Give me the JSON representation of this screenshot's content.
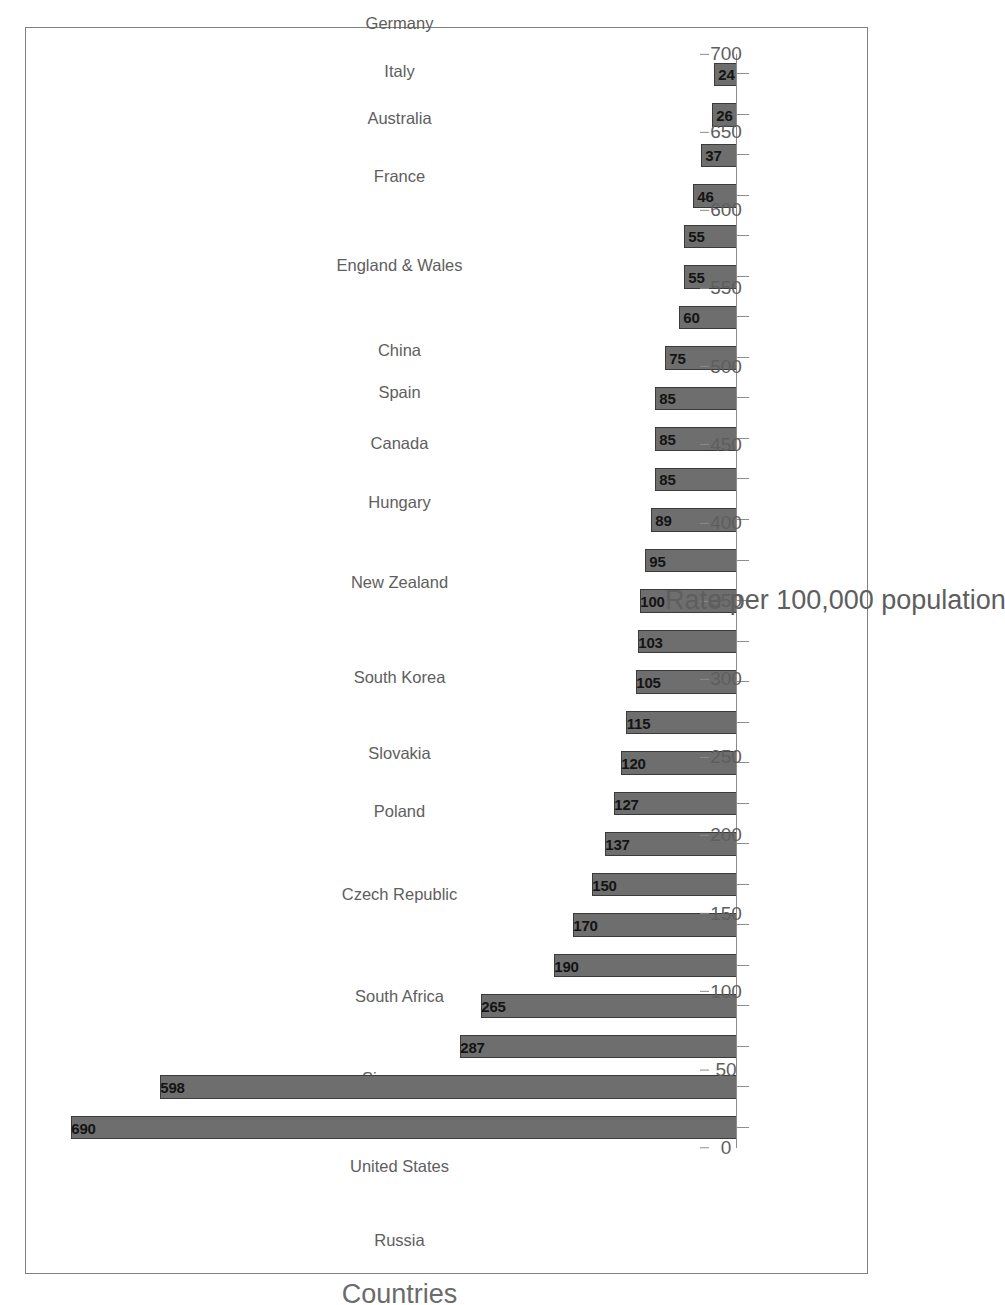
{
  "chart_data": {
    "type": "bar",
    "orientation": "vertical-rotated-90ccw",
    "title": "",
    "xlabel": "Countries",
    "ylabel": "Rate per 100,000 population",
    "ylim": [
      0,
      700
    ],
    "ytick_step": 50,
    "grid": false,
    "legend": null,
    "bar_color": "#6e6e6e",
    "bar_outline_color": "#3b3b3b",
    "axis_color": "#8c8c8c",
    "text_color": "#5e5e5e",
    "value_label_color": "#141414",
    "categories": [
      "Russia",
      "United States",
      "Singapore",
      "South Africa",
      "Czech Republic",
      "Poland",
      "Slovakia",
      "South Korea",
      "New Zealand",
      "Hungary",
      "Canada",
      "Spain",
      "China",
      "England & Wales",
      "France",
      "Australia",
      "Italy",
      "Germany",
      "Austria",
      "Belgium",
      "Finland",
      "Ireland",
      "Greece",
      "Soloman Islands",
      "Japan",
      "Philippines",
      "India"
    ],
    "values": [
      690,
      598,
      287,
      265,
      190,
      170,
      150,
      137,
      127,
      120,
      115,
      105,
      103,
      100,
      95,
      89,
      85,
      85,
      85,
      75,
      60,
      55,
      55,
      46,
      37,
      26,
      24
    ],
    "yticks": [
      0,
      50,
      100,
      150,
      200,
      250,
      300,
      350,
      400,
      450,
      500,
      550,
      600,
      650,
      700
    ],
    "ytick_labels": [
      "0",
      "50",
      "100",
      "150",
      "200",
      "250",
      "300",
      "350",
      "400",
      "450",
      "500",
      "550",
      "600",
      "650",
      "700"
    ]
  }
}
